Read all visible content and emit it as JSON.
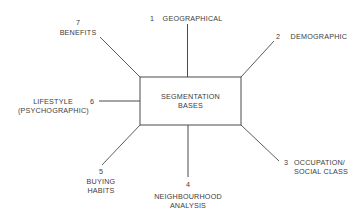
{
  "diagram": {
    "center": {
      "line1": "SEGMENTATION",
      "line2": "BASES"
    },
    "bases": [
      {
        "number": "1",
        "label_lines": [
          "GEOGRAPHICAL"
        ]
      },
      {
        "number": "2",
        "label_lines": [
          "DEMOGRAPHIC"
        ]
      },
      {
        "number": "3",
        "label_lines": [
          "OCCUPATION/",
          "SOCIAL CLASS"
        ]
      },
      {
        "number": "4",
        "label_lines": [
          "NEIGHBOURHOOD",
          "ANALYSIS"
        ]
      },
      {
        "number": "5",
        "label_lines": [
          "BUYING",
          "HABITS"
        ]
      },
      {
        "number": "6",
        "label_lines": [
          "LIFESTYLE",
          "(PSYCHOGRAPHIC)"
        ]
      },
      {
        "number": "7",
        "label_lines": [
          "BENEFITS"
        ]
      }
    ],
    "colors": {
      "line": "#4a4a4a",
      "text": "#3c3c3c",
      "background": "#ffffff"
    }
  }
}
